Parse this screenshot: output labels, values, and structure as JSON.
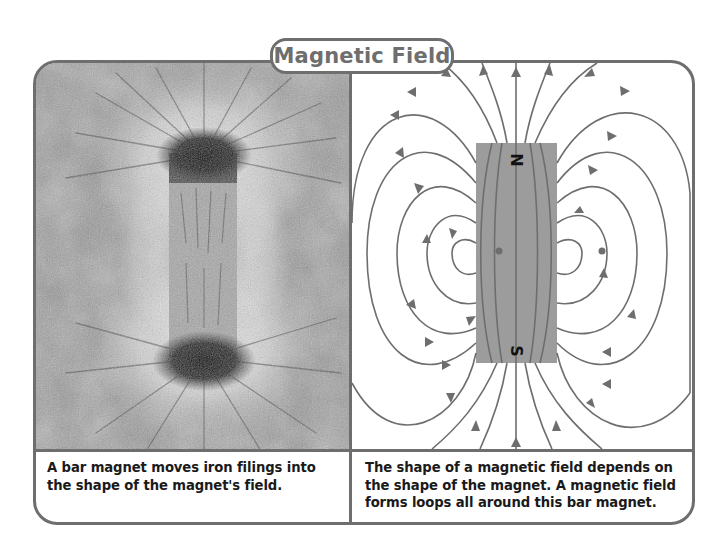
{
  "title": "Magnetic Field",
  "panels": {
    "left": {
      "image_description": "Photograph of iron filings arranged around a bar magnet",
      "caption": "A bar magnet moves iron filings into the shape of the magnet's field."
    },
    "right": {
      "image_description": "Diagram of magnetic field lines looping around a bar magnet",
      "magnet": {
        "north_label": "N",
        "south_label": "S",
        "color": "#9c9c9c"
      },
      "line_color": "#6e6e6e",
      "caption": "The shape of a magnetic field depends on the shape of the magnet. A magnetic field forms loops all around this bar magnet."
    }
  },
  "colors": {
    "frame": "#6e6e6e",
    "title_text": "#6e6e6e",
    "caption_text": "#1a1a1a"
  }
}
